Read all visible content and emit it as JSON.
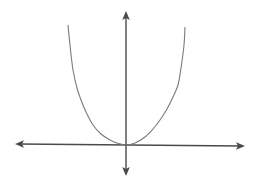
{
  "diagram": {
    "type": "function-graph",
    "canvas": {
      "width": 257,
      "height": 185
    },
    "colors": {
      "background": "#ffffff",
      "axis": "#4a4a4a",
      "curve": "#7a7a7a"
    },
    "origin": {
      "x": 126,
      "y": 145
    },
    "x_axis": {
      "from": {
        "x": 15,
        "y": 144
      },
      "to": {
        "x": 245,
        "y": 146
      },
      "arrows": [
        "left",
        "right"
      ]
    },
    "y_axis": {
      "from": {
        "x": 126,
        "y": 176
      },
      "to": {
        "x": 126,
        "y": 11
      },
      "arrows": [
        "up",
        "down"
      ]
    },
    "curve": {
      "shape": "parabola-like (flat bottom, steep sides)",
      "vertex": {
        "x": 126,
        "y": 145
      },
      "points": [
        [
          68,
          25
        ],
        [
          70,
          45
        ],
        [
          73,
          70
        ],
        [
          77,
          88
        ],
        [
          81,
          100
        ],
        [
          86,
          112
        ],
        [
          93,
          125
        ],
        [
          101,
          134
        ],
        [
          110,
          140
        ],
        [
          117,
          143
        ],
        [
          126,
          145
        ],
        [
          135,
          143
        ],
        [
          145,
          137
        ],
        [
          153,
          129
        ],
        [
          160,
          120
        ],
        [
          167,
          109
        ],
        [
          173,
          97
        ],
        [
          178,
          85
        ],
        [
          181,
          68
        ],
        [
          184,
          45
        ],
        [
          185,
          27
        ]
      ]
    },
    "labels": []
  }
}
